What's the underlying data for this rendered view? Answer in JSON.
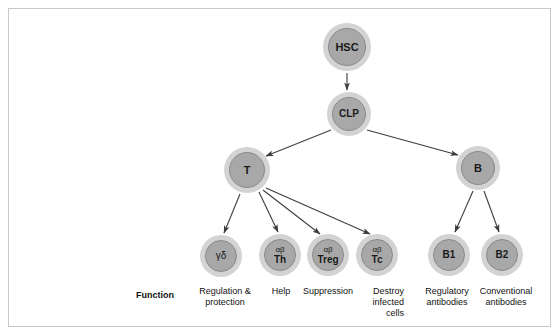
{
  "diagram": {
    "palette": {
      "node_outer": "#d3d3d3",
      "node_inner": "#a8a8a8",
      "node_inner_border": "#8a8a8a",
      "edge": "#3d3d3d",
      "text": "#111111",
      "frame_border": "#c9c9c9",
      "background": "#ffffff"
    },
    "nodes": [
      {
        "id": "hsc",
        "label": "HSC",
        "sup": "",
        "cx": 347,
        "cy": 47,
        "outer_r": 24,
        "inner_r": 19,
        "font_size": 11
      },
      {
        "id": "clp",
        "label": "CLP",
        "sup": "",
        "cx": 349,
        "cy": 114,
        "outer_r": 22,
        "inner_r": 17,
        "font_size": 10
      },
      {
        "id": "t",
        "label": "T",
        "sup": "",
        "cx": 247,
        "cy": 170,
        "outer_r": 23,
        "inner_r": 18,
        "font_size": 11
      },
      {
        "id": "b",
        "label": "B",
        "sup": "",
        "cx": 478,
        "cy": 168,
        "outer_r": 22,
        "inner_r": 17,
        "font_size": 11
      },
      {
        "id": "gd",
        "label": "γδ",
        "sup": "",
        "cx": 221,
        "cy": 256,
        "outer_r": 21,
        "inner_r": 16,
        "font_size": 10
      },
      {
        "id": "th",
        "label": "Th",
        "sup": "αβ",
        "cx": 280,
        "cy": 255,
        "outer_r": 21,
        "inner_r": 16,
        "font_size": 10
      },
      {
        "id": "treg",
        "label": "Treg",
        "sup": "αβ",
        "cx": 328,
        "cy": 255,
        "outer_r": 21,
        "inner_r": 16,
        "font_size": 10
      },
      {
        "id": "tc",
        "label": "Tc",
        "sup": "αβ",
        "cx": 377,
        "cy": 255,
        "outer_r": 21,
        "inner_r": 16,
        "font_size": 10
      },
      {
        "id": "b1",
        "label": "B1",
        "sup": "",
        "cx": 449,
        "cy": 255,
        "outer_r": 21,
        "inner_r": 16,
        "font_size": 10
      },
      {
        "id": "b2",
        "label": "B2",
        "sup": "",
        "cx": 502,
        "cy": 255,
        "outer_r": 21,
        "inner_r": 16,
        "font_size": 10
      }
    ],
    "edges": [
      {
        "from": "hsc",
        "to": "clp",
        "x1": 347,
        "y1": 73,
        "x2": 347,
        "y2": 90
      },
      {
        "from": "clp",
        "to": "t",
        "x1": 331,
        "y1": 130,
        "x2": 266,
        "y2": 156
      },
      {
        "from": "clp",
        "to": "b",
        "x1": 367,
        "y1": 130,
        "x2": 458,
        "y2": 155
      },
      {
        "from": "t",
        "to": "gd",
        "x1": 240,
        "y1": 194,
        "x2": 224,
        "y2": 233
      },
      {
        "from": "t",
        "to": "th",
        "x1": 259,
        "y1": 192,
        "x2": 278,
        "y2": 232
      },
      {
        "from": "t",
        "to": "treg",
        "x1": 263,
        "y1": 190,
        "x2": 320,
        "y2": 234
      },
      {
        "from": "t",
        "to": "tc",
        "x1": 266,
        "y1": 188,
        "x2": 370,
        "y2": 234
      },
      {
        "from": "b",
        "to": "b1",
        "x1": 473,
        "y1": 191,
        "x2": 455,
        "y2": 232
      },
      {
        "from": "b",
        "to": "b2",
        "x1": 484,
        "y1": 191,
        "x2": 499,
        "y2": 232
      }
    ],
    "function_row": {
      "label": "Function",
      "label_x": 136,
      "label_y": 290,
      "items": [
        {
          "for": "gd",
          "lines": [
            "Regulation &",
            "protection"
          ],
          "x": 189,
          "y": 286,
          "width": 72,
          "align": "center"
        },
        {
          "for": "th",
          "lines": [
            "Help"
          ],
          "x": 265,
          "y": 286,
          "width": 32,
          "align": "center"
        },
        {
          "for": "treg",
          "lines": [
            "Suppression"
          ],
          "x": 296,
          "y": 286,
          "width": 64,
          "align": "center"
        },
        {
          "for": "tc",
          "lines": [
            "Destroy",
            "infected",
            "cells"
          ],
          "x": 352,
          "y": 286,
          "width": 52,
          "align": "right"
        },
        {
          "for": "b1",
          "lines": [
            "Regulatory",
            "antibodies"
          ],
          "x": 414,
          "y": 286,
          "width": 66,
          "align": "center"
        },
        {
          "for": "b2",
          "lines": [
            "Conventional",
            "antibodies"
          ],
          "x": 470,
          "y": 286,
          "width": 72,
          "align": "center"
        }
      ]
    }
  }
}
